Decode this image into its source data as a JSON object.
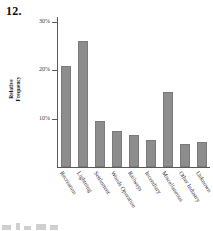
{
  "problem": {
    "number": "12."
  },
  "chart_data": {
    "type": "bar",
    "title": "",
    "xlabel": "",
    "ylabel": "Relative Frequency",
    "ylabel_line1": "Relative",
    "ylabel_line2": "Frequency",
    "ylim": [
      0,
      32
    ],
    "grid": false,
    "legend": "none",
    "bar_color": "#8d8d8d",
    "axis_color": "#5a5a5a",
    "ytick_labels": [
      "30%",
      "20%",
      "10%"
    ],
    "ytick_values": [
      30,
      20,
      10
    ],
    "categories": [
      "Recreation",
      "Lightning",
      "Settlement",
      "Woods Operation",
      "Railways",
      "Incendiary",
      "Miscellaneous",
      "Other Industry",
      "Unknown"
    ],
    "values": [
      21.0,
      26.0,
      9.5,
      7.5,
      6.7,
      5.5,
      15.5,
      4.8,
      5.2
    ]
  },
  "artifacts": [
    {
      "left": 0,
      "width": 9,
      "height": 5
    },
    {
      "left": 14,
      "width": 4,
      "height": 7
    },
    {
      "left": 22,
      "width": 7,
      "height": 4
    },
    {
      "left": 34,
      "width": 10,
      "height": 6
    },
    {
      "left": 48,
      "width": 8,
      "height": 5
    }
  ]
}
